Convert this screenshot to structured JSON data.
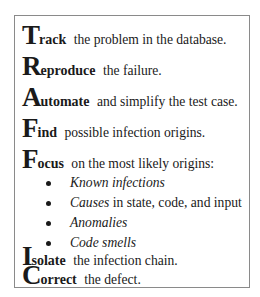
{
  "steps": [
    {
      "letter": "T",
      "keyword": "rack",
      "rest": "the problem in the database."
    },
    {
      "letter": "R",
      "keyword": "eproduce",
      "rest": "the failure."
    },
    {
      "letter": "A",
      "keyword": "utomate",
      "rest": "and simplify the test case."
    },
    {
      "letter": "F",
      "keyword": "ind",
      "rest": "possible infection origins."
    },
    {
      "letter": "F",
      "keyword": "ocus",
      "rest": "on the most likely origins:"
    },
    {
      "letter": "I",
      "keyword": "solate",
      "rest": "the infection chain."
    },
    {
      "letter": "C",
      "keyword": "orrect",
      "rest": "the defect."
    }
  ],
  "bullets": [
    {
      "italic": "Known infections",
      "rest": ""
    },
    {
      "italic": "Causes",
      "rest": " in state, code, and input"
    },
    {
      "italic": "Anomalies",
      "rest": ""
    },
    {
      "italic": "Code smells",
      "rest": ""
    }
  ]
}
